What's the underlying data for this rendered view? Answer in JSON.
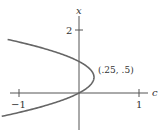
{
  "chart_data": {
    "type": "line",
    "title": "",
    "xlabel": "c",
    "ylabel": "x",
    "equation": "c = x - x^2",
    "x_axis": {
      "label": "c",
      "ticks": [
        {
          "value": -1,
          "label": "-1"
        },
        {
          "value": 1,
          "label": "1"
        }
      ],
      "range": [
        -1.15,
        1.15
      ]
    },
    "y_axis": {
      "label": "x",
      "ticks": [
        {
          "value": 2,
          "label": "2"
        }
      ],
      "range": [
        -1.3,
        2.35
      ]
    },
    "series": [
      {
        "name": "parabola",
        "points_cx": [
          [
            -1.19,
            1.7
          ],
          [
            -0.75,
            1.5
          ],
          [
            -0.56,
            1.25
          ],
          [
            -0.25,
            1.0
          ],
          [
            0.0,
            1.0
          ],
          [
            0.1875,
            0.75
          ],
          [
            0.25,
            0.5
          ],
          [
            0.1875,
            0.25
          ],
          [
            0.0,
            0.0
          ],
          [
            -0.3125,
            -0.25
          ],
          [
            -0.75,
            -0.5
          ],
          [
            -1.31,
            -0.75
          ]
        ]
      }
    ],
    "annotations": [
      {
        "text": "(.25, .5)",
        "c": 0.25,
        "x": 0.5
      }
    ],
    "grid": false,
    "legend": null
  },
  "labels": {
    "x_axis_name": "c",
    "y_axis_name": "x",
    "tick_neg1": "−1",
    "tick_pos1": "1",
    "tick_y2": "2",
    "vertex": "(.25, .5)"
  }
}
